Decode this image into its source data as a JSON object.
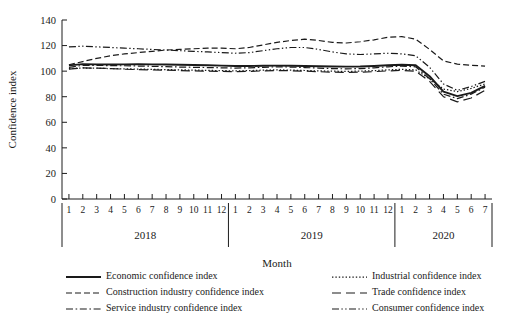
{
  "chart_data": {
    "type": "line",
    "title": "",
    "xlabel": "Month",
    "ylabel": "Confidence index",
    "ylim": [
      0,
      140
    ],
    "ytick_step": 20,
    "yticks": [
      0,
      20,
      40,
      60,
      80,
      100,
      120,
      140
    ],
    "grid": false,
    "legend_position": "bottom",
    "year_groups": [
      {
        "year": "2018",
        "months": [
          "1",
          "2",
          "3",
          "4",
          "5",
          "6",
          "7",
          "8",
          "9",
          "10",
          "11",
          "12"
        ]
      },
      {
        "year": "2019",
        "months": [
          "1",
          "2",
          "3",
          "4",
          "5",
          "6",
          "7",
          "8",
          "9",
          "10",
          "11",
          "12"
        ]
      },
      {
        "year": "2020",
        "months": [
          "1",
          "2",
          "3",
          "4",
          "5",
          "6",
          "7"
        ]
      }
    ],
    "x": [
      "2018-1",
      "2018-2",
      "2018-3",
      "2018-4",
      "2018-5",
      "2018-6",
      "2018-7",
      "2018-8",
      "2018-9",
      "2018-10",
      "2018-11",
      "2018-12",
      "2019-1",
      "2019-2",
      "2019-3",
      "2019-4",
      "2019-5",
      "2019-6",
      "2019-7",
      "2019-8",
      "2019-9",
      "2019-10",
      "2019-11",
      "2019-12",
      "2020-1",
      "2020-2",
      "2020-3",
      "2020-4",
      "2020-5",
      "2020-6",
      "2020-7"
    ],
    "series": [
      {
        "name": "Economic confidence index",
        "style": "solid",
        "values": [
          104.5,
          105.5,
          105.3,
          105.2,
          105.3,
          105.4,
          105.3,
          105.2,
          105.0,
          104.8,
          104.6,
          104.3,
          104.0,
          104.0,
          104.2,
          104.3,
          104.2,
          104.0,
          103.8,
          103.6,
          103.5,
          103.6,
          104.0,
          104.6,
          105.0,
          104.6,
          96.0,
          84.0,
          80.5,
          83.0,
          88.5
        ]
      },
      {
        "name": "Industrial confidence index",
        "style": "dotted",
        "values": [
          102.0,
          102.5,
          102.3,
          102.0,
          101.8,
          101.6,
          101.4,
          101.2,
          101.0,
          100.8,
          100.6,
          100.4,
          100.2,
          100.4,
          100.8,
          101.0,
          100.8,
          100.5,
          100.2,
          100.0,
          99.8,
          100.0,
          100.4,
          101.0,
          101.4,
          101.0,
          94.0,
          86.0,
          84.0,
          86.5,
          90.0
        ]
      },
      {
        "name": "Construction industry confidence index",
        "style": "dashed",
        "values": [
          105.0,
          107.5,
          110.0,
          112.0,
          113.5,
          114.5,
          115.5,
          116.5,
          117.0,
          117.5,
          118.0,
          118.0,
          117.5,
          118.5,
          120.5,
          122.5,
          124.0,
          125.0,
          124.0,
          122.5,
          122.0,
          123.0,
          124.5,
          126.5,
          127.0,
          125.0,
          117.0,
          108.0,
          105.5,
          104.5,
          104.0
        ]
      },
      {
        "name": "Trade confidence index",
        "style": "longdash",
        "values": [
          101.5,
          102.5,
          102.3,
          102.0,
          101.5,
          101.2,
          101.0,
          100.8,
          100.5,
          100.2,
          100.0,
          99.8,
          99.6,
          99.8,
          100.2,
          100.5,
          100.3,
          100.0,
          99.6,
          99.2,
          99.0,
          99.2,
          99.6,
          100.2,
          100.6,
          100.0,
          92.0,
          80.0,
          76.0,
          79.0,
          85.0
        ]
      },
      {
        "name": "Service industry confidence index",
        "style": "dashdot",
        "values": [
          103.0,
          104.5,
          104.5,
          104.3,
          104.2,
          104.0,
          103.8,
          103.5,
          103.2,
          103.0,
          102.8,
          102.6,
          102.4,
          102.6,
          103.0,
          103.4,
          103.2,
          102.8,
          102.4,
          102.0,
          101.8,
          102.0,
          102.6,
          103.4,
          104.0,
          103.4,
          94.0,
          82.0,
          78.5,
          82.0,
          87.5
        ]
      },
      {
        "name": "Consumer confidence index",
        "style": "dashdotdot",
        "values": [
          119.0,
          119.5,
          119.0,
          118.5,
          118.0,
          117.5,
          117.0,
          116.5,
          116.0,
          115.5,
          115.0,
          114.5,
          114.0,
          114.5,
          116.0,
          117.5,
          118.5,
          118.5,
          117.0,
          115.0,
          113.5,
          113.0,
          113.5,
          114.0,
          113.5,
          112.0,
          103.0,
          90.0,
          85.0,
          88.0,
          92.0
        ]
      }
    ]
  },
  "legend": {
    "rows": [
      {
        "left": "Economic confidence index",
        "right": "Industrial confidence index"
      },
      {
        "left": "Construction industry confidence index",
        "right": "Trade confidence index"
      },
      {
        "left": "Service industry confidence index",
        "right": "Consumer confidence index"
      }
    ]
  }
}
